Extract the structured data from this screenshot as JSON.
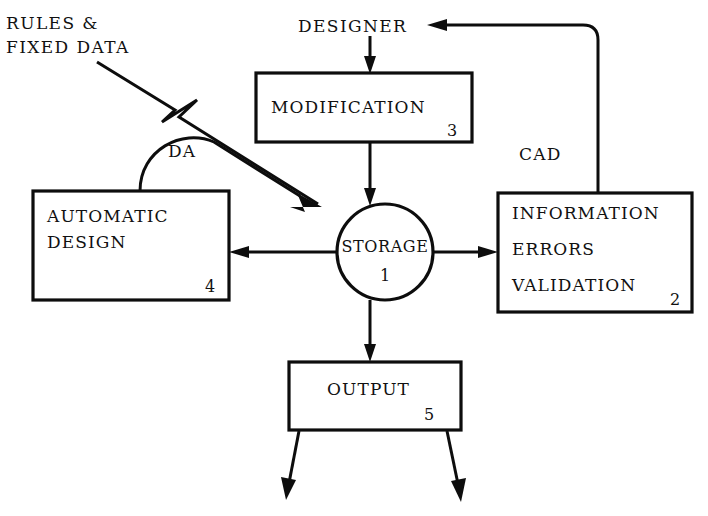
{
  "diagram": {
    "background_color": "#ffffff",
    "line_color": "#0d0d0d",
    "nodes": [
      {
        "id": "storage",
        "shape": "circle",
        "label": "STORAGE",
        "number": "1",
        "lines": [
          "STORAGE"
        ]
      },
      {
        "id": "information",
        "shape": "box",
        "number": "2",
        "lines": [
          "INFORMATION",
          "ERRORS",
          "VALIDATION"
        ]
      },
      {
        "id": "modification",
        "shape": "box",
        "number": "3",
        "lines": [
          "MODIFICATION"
        ]
      },
      {
        "id": "automatic-design",
        "shape": "box",
        "number": "4",
        "lines": [
          "AUTOMATIC",
          "DESIGN"
        ]
      },
      {
        "id": "output",
        "shape": "box",
        "number": "5",
        "lines": [
          "OUTPUT"
        ]
      }
    ],
    "free_labels": [
      {
        "id": "rules-fixed-data",
        "lines": [
          "RULES &",
          "FIXED DATA"
        ]
      },
      {
        "id": "designer",
        "lines": [
          "DESIGNER"
        ]
      }
    ],
    "edge_labels": [
      {
        "id": "da",
        "text": "DA"
      },
      {
        "id": "cad",
        "text": "CAD"
      }
    ]
  }
}
